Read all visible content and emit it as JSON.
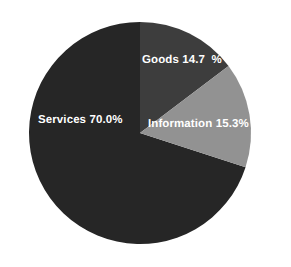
{
  "chart_data": {
    "type": "pie",
    "title": "",
    "subtitle": "",
    "xlabel": "",
    "ylabel": "",
    "grid": false,
    "legend_position": "none",
    "labels_inside_slices": true,
    "start_angle_deg": 0,
    "direction": "clockwise",
    "categories": [
      "Services",
      "Goods",
      "Information"
    ],
    "values": [
      70.0,
      14.7,
      15.3
    ],
    "units": "percent",
    "total": 100.0,
    "slices": [
      {
        "name": "Services",
        "value": 70.0,
        "value_text": "70.0%",
        "label": "Services 70.0%",
        "color": "#262626",
        "start_deg": 108.0,
        "end_deg": 360.0,
        "label_color": "#ffffff"
      },
      {
        "name": "Goods",
        "value": 14.7,
        "value_text": "14.7  %",
        "label": "Goods 14.7  %",
        "color": "#3d3d3d",
        "start_deg": 0.0,
        "end_deg": 52.92,
        "label_color": "#ffffff"
      },
      {
        "name": "Information",
        "value": 15.3,
        "value_text": "15.3%",
        "label": "Information 15.3%",
        "color": "#929292",
        "start_deg": 52.92,
        "end_deg": 108.0,
        "label_color": "#ffffff"
      }
    ],
    "geometry": {
      "center_x": 140,
      "center_y": 133,
      "radius": 111
    },
    "background_color": "#ffffff"
  }
}
